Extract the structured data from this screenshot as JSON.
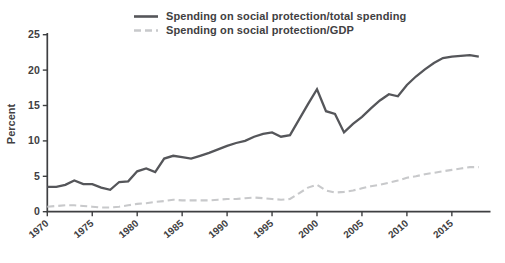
{
  "chart_data": {
    "type": "line",
    "title": "",
    "xlabel": "",
    "ylabel": "Percent",
    "ylim": [
      0,
      25
    ],
    "yticks": [
      0,
      5,
      10,
      15,
      20,
      25
    ],
    "xticks": [
      1970,
      1975,
      1980,
      1985,
      1990,
      1995,
      2000,
      2005,
      2010,
      2015
    ],
    "grid": false,
    "legend_position": "top-center",
    "x": [
      1970,
      1971,
      1972,
      1973,
      1974,
      1975,
      1976,
      1977,
      1978,
      1979,
      1980,
      1981,
      1982,
      1983,
      1984,
      1985,
      1986,
      1987,
      1988,
      1989,
      1990,
      1991,
      1992,
      1993,
      1994,
      1995,
      1996,
      1997,
      1998,
      1999,
      2000,
      2001,
      2002,
      2003,
      2004,
      2005,
      2006,
      2007,
      2008,
      2009,
      2010,
      2011,
      2012,
      2013,
      2014,
      2015,
      2016,
      2017,
      2018
    ],
    "series": [
      {
        "id": "total-spending",
        "name": "Spending on social protection/total spending",
        "line_style": "solid",
        "color": "#55565a",
        "values": [
          3.5,
          3.5,
          3.8,
          4.4,
          3.9,
          3.9,
          3.4,
          3.1,
          4.2,
          4.3,
          5.7,
          6.1,
          5.6,
          7.5,
          7.9,
          7.7,
          7.5,
          7.9,
          8.3,
          8.8,
          9.3,
          9.7,
          10.0,
          10.6,
          11.0,
          11.2,
          10.6,
          10.8,
          13.0,
          15.2,
          17.3,
          14.2,
          13.8,
          11.2,
          12.4,
          13.4,
          14.6,
          15.7,
          16.6,
          16.3,
          17.9,
          19.1,
          20.1,
          21.0,
          21.7,
          21.9,
          22.0,
          22.1,
          21.9
        ]
      },
      {
        "id": "gdp",
        "name": "Spending on social protection/GDP",
        "line_style": "dashed",
        "color": "#c8c9cb",
        "values": [
          0.7,
          0.8,
          0.9,
          0.9,
          0.8,
          0.7,
          0.6,
          0.6,
          0.7,
          0.9,
          1.1,
          1.2,
          1.4,
          1.5,
          1.7,
          1.6,
          1.6,
          1.6,
          1.6,
          1.7,
          1.8,
          1.8,
          1.9,
          2.0,
          1.9,
          1.8,
          1.7,
          1.8,
          2.6,
          3.4,
          3.8,
          3.0,
          2.7,
          2.8,
          3.0,
          3.3,
          3.6,
          3.8,
          4.1,
          4.4,
          4.8,
          5.0,
          5.3,
          5.5,
          5.7,
          5.9,
          6.1,
          6.3,
          6.3
        ]
      }
    ],
    "axis_color": "#3e3f41",
    "tick_label_color": "#414042"
  }
}
